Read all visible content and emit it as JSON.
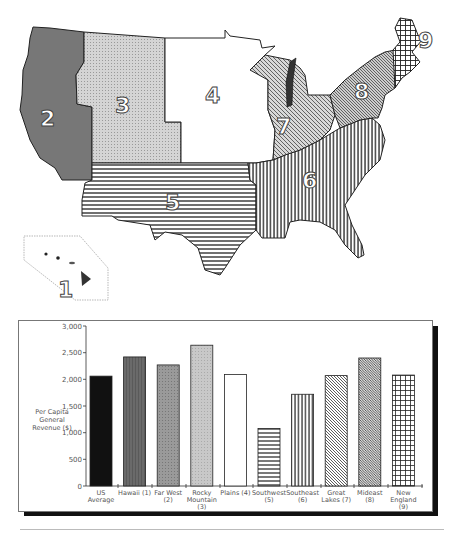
{
  "map": {
    "title": "US Census Bureau of Economic Analysis regions",
    "regions": [
      {
        "id": 1,
        "name": "Hawaii",
        "label": "1",
        "pattern": "solid-dark"
      },
      {
        "id": 2,
        "name": "Far West",
        "label": "2",
        "pattern": "solid-gray"
      },
      {
        "id": 3,
        "name": "Rocky Mountain",
        "label": "3",
        "pattern": "light-stipple"
      },
      {
        "id": 4,
        "name": "Plains",
        "label": "4",
        "pattern": "white"
      },
      {
        "id": 5,
        "name": "Southwest",
        "label": "5",
        "pattern": "horizontal-lines"
      },
      {
        "id": 6,
        "name": "Southeast",
        "label": "6",
        "pattern": "vertical-lines"
      },
      {
        "id": 7,
        "name": "Great Lakes",
        "label": "7",
        "pattern": "diagonal-lines"
      },
      {
        "id": 8,
        "name": "Mideast",
        "label": "8",
        "pattern": "dense-diagonal"
      },
      {
        "id": 9,
        "name": "New England",
        "label": "9",
        "pattern": "grid"
      }
    ]
  },
  "chart_data": {
    "type": "bar",
    "title": "",
    "xlabel": "",
    "ylabel": "Per Capita General Revenue ($)",
    "ylabel_lines": [
      "Per Capita",
      "General",
      "Revenue ($)"
    ],
    "ylim": [
      0,
      3000
    ],
    "yticks": [
      0,
      500,
      1000,
      1500,
      2000,
      2500,
      3000
    ],
    "ytick_labels": [
      "0",
      "500",
      "1,000",
      "1,500",
      "2,000",
      "2,500",
      "3,000"
    ],
    "grid": false,
    "legend": "none",
    "categories": [
      "US Average",
      "Hawaii (1)",
      "Far West (2)",
      "Rocky Mountain (3)",
      "Plains (4)",
      "Southwest (5)",
      "Southeast (6)",
      "Great Lakes (7)",
      "Mideast (8)",
      "New England (9)"
    ],
    "category_lines": [
      [
        "US",
        "Average"
      ],
      [
        "Hawaii (1)"
      ],
      [
        "Far West",
        "(2)"
      ],
      [
        "Rocky",
        "Mountain",
        "(3)"
      ],
      [
        "Plains (4)"
      ],
      [
        "Southwest",
        "(5)"
      ],
      [
        "Southeast",
        "(6)"
      ],
      [
        "Great",
        "Lakes (7)"
      ],
      [
        "Mideast",
        "(8)"
      ],
      [
        "New",
        "England",
        "(9)"
      ]
    ],
    "values": [
      2060,
      2420,
      2270,
      2640,
      2090,
      1080,
      1720,
      2070,
      2400,
      2080
    ],
    "patterns": [
      "black",
      "dark-gray",
      "gray-stipple",
      "light-stipple",
      "white",
      "horizontal-lines",
      "vertical-lines",
      "diagonal-lines",
      "dense-diagonal",
      "grid"
    ]
  }
}
